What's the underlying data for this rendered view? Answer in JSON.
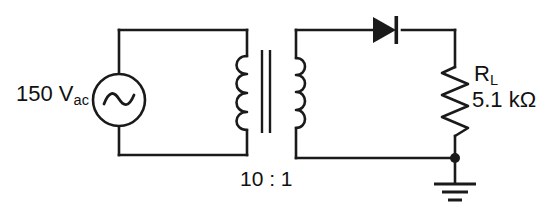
{
  "figure": {
    "background_color": "#ffffff",
    "ink_color": "#1a1a1a"
  },
  "source": {
    "name": "ac-voltage-source",
    "magnitude": "150",
    "unit": "V",
    "unit_subscript": "ac",
    "label": "150 V",
    "symbol": "sine-wave-in-circle"
  },
  "transformer": {
    "name": "step-down-transformer",
    "turns_ratio_label": "10 : 1",
    "primary_turns": "10",
    "secondary_turns": "1",
    "primary_coil_bumps": 4,
    "secondary_coil_bumps": 4,
    "core_bars": 2
  },
  "diode": {
    "name": "rectifier-diode",
    "orientation": "anode-left-cathode-right",
    "label": ""
  },
  "load_resistor": {
    "name": "load-resistor",
    "designator": "R",
    "designator_subscript": "L",
    "value": "5.1 kΩ",
    "resistance_number": "5.1",
    "resistance_unit": "kΩ",
    "zigzag_peaks": 6
  },
  "ground": {
    "name": "earth-ground",
    "bars": 3,
    "label": ""
  },
  "nodes": {
    "junction_dot_label": "output-node"
  }
}
